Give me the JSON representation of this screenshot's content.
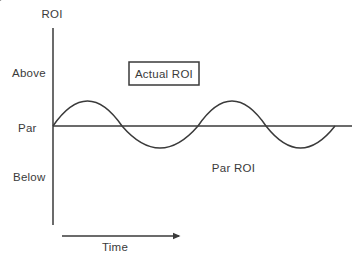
{
  "colors": {
    "ink": "#3a3a3a",
    "background": "#ffffff"
  },
  "axis": {
    "y_title": "ROI",
    "x_title": "Time",
    "tick_above": "Above",
    "tick_par": "Par",
    "tick_below": "Below"
  },
  "callouts": {
    "actual_roi": "Actual ROI",
    "par_roi": "Par ROI"
  },
  "chart_data": {
    "type": "line",
    "xlabel": "Time",
    "ylabel": "ROI",
    "x_axis_numeric": false,
    "y_tick_labels": [
      "Above",
      "Par",
      "Below"
    ],
    "grid": false,
    "legend": "none",
    "series": [
      {
        "name": "Actual ROI",
        "shape": "sine",
        "cycles": 2,
        "relative_values_vs_par": [
          0,
          1,
          0,
          -1,
          0,
          1,
          0,
          -1,
          0
        ],
        "description": "Sinusoidal curve starting at Par on the y-axis, rising Above, dipping Below, twice, ending back at Par"
      },
      {
        "name": "Par ROI",
        "shape": "horizontal-line",
        "level": "Par",
        "description": "Straight horizontal reference line at the Par level"
      }
    ],
    "annotations": [
      {
        "label": "Actual ROI",
        "target": "second peak of the sine curve",
        "arrow": "elbow right then down"
      },
      {
        "label": "Par ROI",
        "target": "horizontal Par line",
        "arrow": "straight up"
      }
    ],
    "geometry": {
      "canvas": {
        "w": 361,
        "h": 261
      },
      "y_axis": {
        "x": 53,
        "y1": 28,
        "y2": 225
      },
      "par_line": {
        "y": 126,
        "x1": 53,
        "x2": 352
      },
      "wave": {
        "crossings_x": [
          53,
          122,
          198,
          266,
          335
        ],
        "peak_y": 101,
        "trough_y": 148,
        "par_y": 126
      },
      "actual_box": {
        "x": 129,
        "y": 62,
        "w": 70,
        "h": 23
      },
      "actual_connector": {
        "start_x": 199,
        "mid_y": 73,
        "elbow_x": 232,
        "end_y": 94
      },
      "par_connector": {
        "x": 233,
        "y1": 155,
        "y2": 134
      },
      "time_arrow": {
        "y": 236,
        "x1": 62,
        "x2": 179
      }
    }
  }
}
